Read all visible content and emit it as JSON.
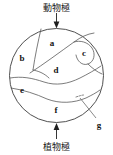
{
  "figure": {
    "name": "amphibian-egg-fate-map",
    "background_color": "#ffffff",
    "stroke_color": "#4a4a4a",
    "outline_color": "#3c3c3c",
    "label_color": "#141414"
  },
  "poles": {
    "animal": {
      "label": "動物極",
      "arrow": "down-arrow-icon",
      "position": "top"
    },
    "vegetal": {
      "label": "植物極",
      "arrow": "up-arrow-icon",
      "position": "bottom"
    }
  },
  "regions": [
    {
      "key": "a",
      "label": "a",
      "x": 52,
      "y": 39
    },
    {
      "key": "b",
      "label": "b",
      "x": 22,
      "y": 54
    },
    {
      "key": "c",
      "label": "c",
      "x": 84,
      "y": 49
    },
    {
      "key": "d",
      "label": "d",
      "x": 56,
      "y": 66
    },
    {
      "key": "e",
      "label": "e",
      "x": 22,
      "y": 86
    },
    {
      "key": "f",
      "label": "f",
      "x": 56,
      "y": 106
    },
    {
      "key": "g",
      "label": "g",
      "x": 99,
      "y": 122
    }
  ],
  "callout": {
    "target_key": "g",
    "leader_line": "diagonal-leader-line",
    "from": {
      "x": 97,
      "y": 119
    },
    "to": {
      "x": 80,
      "y": 100
    }
  },
  "circle": {
    "center_x": 56.5,
    "center_y": 75.5,
    "radius": 47
  }
}
